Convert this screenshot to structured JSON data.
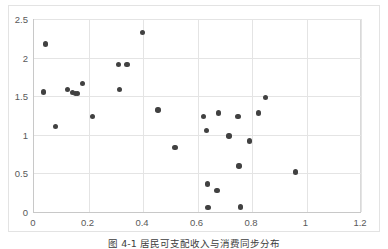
{
  "figure": {
    "caption": "图 4-1  居民可支配收入与消费同步分布",
    "background_color": "#ffffff",
    "frame_color": "#e3e3e3"
  },
  "chart_data": {
    "type": "scatter",
    "title": "",
    "xlabel": "",
    "ylabel": "",
    "xlim": [
      0,
      1.2
    ],
    "ylim": [
      0,
      2.5
    ],
    "xticks": [
      "0",
      "0.2",
      "0.4",
      "0.6",
      "0.8",
      "1",
      "1.2"
    ],
    "xtick_values": [
      0,
      0.2,
      0.4,
      0.6,
      0.8,
      1,
      1.2
    ],
    "yticks": [
      "0",
      "0.5",
      "1",
      "1.5",
      "2",
      "2.5"
    ],
    "ytick_values": [
      0,
      0.5,
      1,
      1.5,
      2,
      2.5
    ],
    "grid": true,
    "legend": "none",
    "marker_color": "#414141",
    "marker_size": 5.4,
    "gridline_color": "#e4e4e4",
    "axis_color": "#c8c8c8",
    "tick_label_color": "#595959",
    "points": [
      [
        0.034,
        1.556
      ],
      [
        0.043,
        2.176
      ],
      [
        0.079,
        1.106
      ],
      [
        0.122,
        1.586
      ],
      [
        0.142,
        1.546
      ],
      [
        0.152,
        1.536
      ],
      [
        0.159,
        1.536
      ],
      [
        0.178,
        1.663
      ],
      [
        0.214,
        1.235
      ],
      [
        0.311,
        1.913
      ],
      [
        0.313,
        1.583
      ],
      [
        0.341,
        1.911
      ],
      [
        0.398,
        2.322
      ],
      [
        0.455,
        1.32
      ],
      [
        0.518,
        0.833
      ],
      [
        0.621,
        1.24
      ],
      [
        0.634,
        1.058
      ],
      [
        0.637,
        0.363
      ],
      [
        0.639,
        0.058
      ],
      [
        0.672,
        0.281
      ],
      [
        0.678,
        1.281
      ],
      [
        0.716,
        0.985
      ],
      [
        0.749,
        1.235
      ],
      [
        0.752,
        0.597
      ],
      [
        0.757,
        0.063
      ],
      [
        0.79,
        0.918
      ],
      [
        0.823,
        1.283
      ],
      [
        0.85,
        1.483
      ],
      [
        0.96,
        0.517
      ]
    ]
  }
}
